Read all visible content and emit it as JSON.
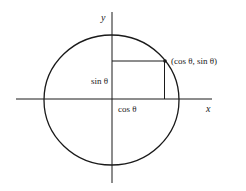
{
  "diagram": {
    "type": "unit-circle",
    "labels": {
      "x_axis": "x",
      "y_axis": "y",
      "point": "(cos θ, sin θ)",
      "vertical_segment": "sin θ",
      "horizontal_segment": "cos θ"
    },
    "colors": {
      "stroke": "#1a1a1a",
      "background": "#ffffff"
    }
  }
}
